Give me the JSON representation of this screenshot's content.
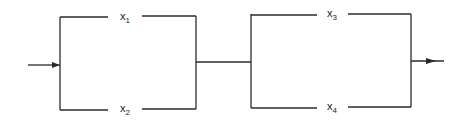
{
  "diagram": {
    "type": "reliability-block-diagram",
    "blocks": [
      {
        "name": "parallel-block-1",
        "components": [
          {
            "id": "x1",
            "var": "x",
            "sub": "1",
            "position": "top"
          },
          {
            "id": "x2",
            "var": "x",
            "sub": "2",
            "position": "bottom"
          }
        ]
      },
      {
        "name": "parallel-block-2",
        "components": [
          {
            "id": "x3",
            "var": "x",
            "sub": "3",
            "position": "top"
          },
          {
            "id": "x4",
            "var": "x",
            "sub": "4",
            "position": "bottom"
          }
        ]
      }
    ],
    "input_arrow": "arrow-right",
    "output_arrow": "arrow-right",
    "line_color": "#2a2a2a",
    "background": "#ffffff"
  }
}
